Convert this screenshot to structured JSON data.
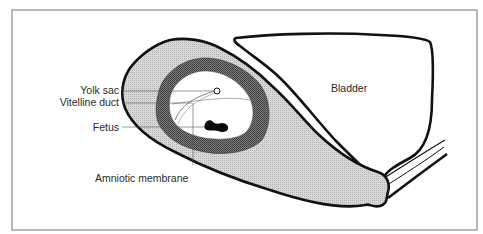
{
  "diagram": {
    "type": "anatomical-cross-section",
    "labels": {
      "yolk_sac": "Yolk sac",
      "vitelline_duct": "Vitelline duct",
      "fetus": "Fetus",
      "amniotic_membrane": "Amniotic membrane",
      "bladder": "Bladder"
    },
    "colors": {
      "background": "#ffffff",
      "frame": "#8a8a8a",
      "outline": "#111111",
      "uterine_wall": "#cfcfcf",
      "chorionic_ring": "#6a6a6a",
      "cavity": "#ffffff",
      "fetus": "#0a0a0a",
      "leader_line": "#555555"
    }
  }
}
